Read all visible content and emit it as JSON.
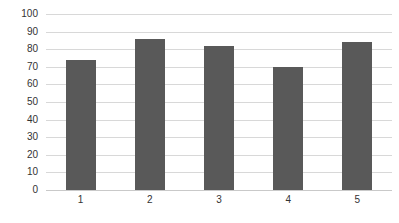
{
  "chart_data": {
    "type": "bar",
    "title": "",
    "subtitle": "",
    "xlabel": "",
    "ylabel": "",
    "categories": [
      "1",
      "2",
      "3",
      "4",
      "5"
    ],
    "values": [
      74,
      86,
      82,
      70,
      84
    ],
    "series": [
      {
        "name": "Series 1",
        "values": [
          74,
          86,
          82,
          70,
          84
        ],
        "color": "#595959"
      }
    ],
    "ylim": [
      0,
      100
    ],
    "yticks": [
      "0",
      "10",
      "20",
      "30",
      "40",
      "50",
      "60",
      "70",
      "80",
      "90",
      "100"
    ],
    "ytick_values": [
      0,
      10,
      20,
      30,
      40,
      50,
      60,
      70,
      80,
      90,
      100
    ],
    "grid": "horizontal",
    "legend": "none",
    "annotations": [],
    "colors": {
      "bar": "#595959",
      "gridline": "#d8d8d8",
      "baseline": "#c9c9c9",
      "text": "#333333",
      "background": "#ffffff"
    }
  }
}
